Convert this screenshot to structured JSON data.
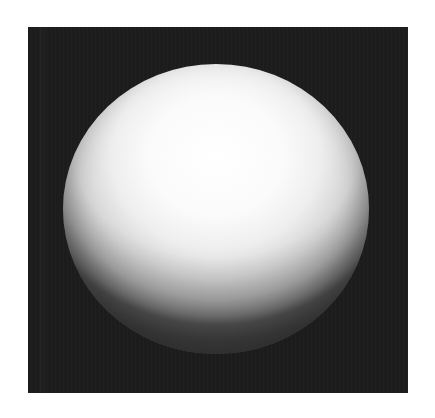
{
  "image": {
    "subject": "white sphere",
    "description": "Photograph of a white matte sphere lit from above, on a dark background",
    "colors": {
      "page_background": "#ffffff",
      "photo_background": "#1c1c1c",
      "sphere_highlight": "#ffffff",
      "sphere_shadow": "#6a6a6a"
    },
    "alt_text": "White sphere on black background"
  }
}
